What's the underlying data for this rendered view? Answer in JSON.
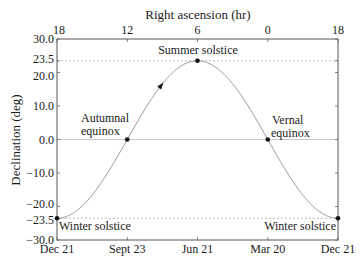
{
  "chart_data": {
    "type": "line",
    "title": "",
    "xlabel_top": "Right ascension (hr)",
    "ylabel": "Declination (deg)",
    "ylim": [
      -30,
      30
    ],
    "yticks": [
      {
        "value": 30.0,
        "label": "30.0"
      },
      {
        "value": 23.5,
        "label": "23.5"
      },
      {
        "value": 20.0,
        "label": "20.0"
      },
      {
        "value": 10.0,
        "label": "10.0"
      },
      {
        "value": 0.0,
        "label": "0.0"
      },
      {
        "value": -10.0,
        "label": "−10.0"
      },
      {
        "value": -20.0,
        "label": "−20.0"
      },
      {
        "value": -23.5,
        "label": "−23.5"
      },
      {
        "value": -30.0,
        "label": "−30.0"
      }
    ],
    "xticks_bottom": [
      "Dec 21",
      "Sept 23",
      "Jun 21",
      "Mar 20",
      "Dec 21"
    ],
    "xticks_top": [
      "18",
      "12",
      "6",
      "0",
      "18"
    ],
    "series": [
      {
        "name": "Sun declination",
        "description": "sinusoid: declination = -23.5*cos(2*pi*t), t from 0 (Dec 21) to 1 (Dec 21)",
        "amplitude": 23.5,
        "x": [
          0,
          0.25,
          0.5,
          0.75,
          1.0
        ],
        "values": [
          -23.5,
          0.0,
          23.5,
          0.0,
          -23.5
        ]
      }
    ],
    "reference_lines": [
      {
        "y": 23.5,
        "style": "dashed"
      },
      {
        "y": 0.0,
        "style": "solid"
      },
      {
        "y": -23.5,
        "style": "dashed"
      }
    ],
    "points": [
      {
        "x": 0,
        "y": -23.5,
        "label": "Winter solstice"
      },
      {
        "x": 0.25,
        "y": 0.0,
        "label": "Autumnal equinox"
      },
      {
        "x": 0.5,
        "y": 23.5,
        "label": "Summer solstice"
      },
      {
        "x": 0.75,
        "y": 0.0,
        "label": "Vernal equinox"
      },
      {
        "x": 1.0,
        "y": -23.5,
        "label": "Winter solstice"
      }
    ],
    "annotations": [
      {
        "text": "Summer solstice"
      },
      {
        "text_lines": [
          "Autumnal",
          "equinox"
        ]
      },
      {
        "text_lines": [
          "Vernal",
          "equinox"
        ]
      },
      {
        "text": "Winter solstice",
        "position": "bottom-left"
      },
      {
        "text": "Winter solstice",
        "position": "bottom-right"
      }
    ],
    "grid": false,
    "direction_arrow": {
      "x": 0.37,
      "meaning": "direction of motion along the curve"
    }
  },
  "labels": {
    "top_axis_title": "Right ascension (hr)",
    "y_axis_title": "Declination (deg)",
    "summer": "Summer solstice",
    "autumnal_1": "Autumnal",
    "autumnal_2": "equinox",
    "vernal_1": "Vernal",
    "vernal_2": "equinox",
    "winter_left": "Winter solstice",
    "winter_right": "Winter solstice"
  },
  "colors": {
    "curve": "#9a9a9a",
    "frame": "#555555",
    "dashed": "#aaaaaa",
    "text": "#1a1a1a"
  }
}
